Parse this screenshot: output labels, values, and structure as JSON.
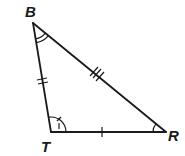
{
  "diagram": {
    "type": "triangle",
    "vertices": {
      "B": {
        "label": "B",
        "x": 33,
        "y": 23
      },
      "T": {
        "label": "T",
        "x": 51,
        "y": 132
      },
      "R": {
        "label": "R",
        "x": 166,
        "y": 132
      }
    },
    "sides": [
      {
        "name": "BT",
        "tick_marks": 2
      },
      {
        "name": "BR",
        "tick_marks": 3
      },
      {
        "name": "TR",
        "tick_marks": 1
      }
    ],
    "angles": [
      {
        "vertex": "B",
        "arc_marks": 2
      },
      {
        "vertex": "T",
        "arc_marks": 1,
        "tick": 1
      },
      {
        "vertex": "R",
        "arc_marks": 1
      }
    ],
    "colors": {
      "stroke": "#1a1a1a",
      "background": "#ffffff"
    }
  }
}
